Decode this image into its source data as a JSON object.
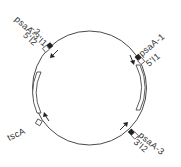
{
  "diagram": {
    "type": "circular gene map",
    "colors": {
      "line": "#4a4a4a",
      "text": "#333333",
      "background": "#ffffff"
    },
    "labels": {
      "top_left_line1": "psaA-3'I1",
      "top_left_line2": "-2",
      "top_left_line3": "5'I2",
      "right_line1": "psaA-1",
      "right_line2": "5'I1",
      "bottom_right_line1": "psaA-3",
      "bottom_right_line2": "3'I2",
      "left": "tscA"
    },
    "markers": [
      {
        "name": "psaA-3/psaA-2 exon junction",
        "position": "top-left",
        "arrow": "down-left"
      },
      {
        "name": "psaA-1",
        "position": "right",
        "arrow": "down"
      },
      {
        "name": "psaA-3",
        "position": "bottom-right",
        "arrow": "up-right"
      },
      {
        "name": "tscA",
        "position": "left",
        "arrow": "up"
      }
    ]
  }
}
